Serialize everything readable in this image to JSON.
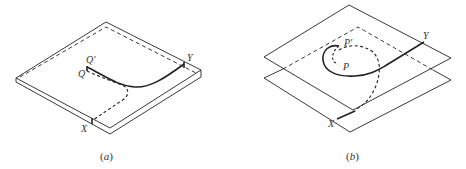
{
  "figure": {
    "panels": [
      {
        "id": "a",
        "caption": "(a)",
        "caption_open": "(",
        "caption_letter": "a",
        "caption_close": ")",
        "labels": {
          "q_prime": "Q′",
          "q": "Q",
          "x": "X",
          "y": "Y"
        }
      },
      {
        "id": "b",
        "caption": "(b)",
        "caption_open": "(",
        "caption_letter": "b",
        "caption_close": ")",
        "labels": {
          "p_prime": "P′",
          "p": "P",
          "x": "X",
          "y": "Y"
        }
      }
    ],
    "colors": {
      "line": "#222222",
      "background": "#ffffff",
      "text": "#333333"
    }
  }
}
